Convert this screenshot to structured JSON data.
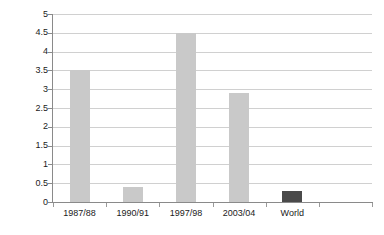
{
  "chart_data": {
    "type": "bar",
    "title": "",
    "subtitle": "",
    "xlabel": "",
    "ylabel": "",
    "categories": [
      "1987/88",
      "1990/91",
      "1997/98",
      "2003/04",
      "World",
      ""
    ],
    "values": [
      3.5,
      0.4,
      4.5,
      2.9,
      0.3,
      null
    ],
    "bar_colors": [
      "#c9c9c9",
      "#c9c9c9",
      "#c9c9c9",
      "#c9c9c9",
      "#4a4a4a",
      "#c9c9c9"
    ],
    "ylim": [
      0,
      5
    ],
    "ytick_step": 0.5,
    "ytick_labels": [
      "5",
      "4.5",
      "4",
      "3.5",
      "3",
      "2.5",
      "2",
      "1.5",
      "1",
      "0.5",
      "0"
    ],
    "ytick_values": [
      5,
      4.5,
      4,
      3.5,
      3,
      2.5,
      2,
      1.5,
      1,
      0.5,
      0
    ],
    "grid": true,
    "grid_axis": "y",
    "legend": null,
    "legend_position": "none",
    "annotations": [],
    "series": [
      {
        "name": "",
        "values": [
          3.5,
          0.4,
          4.5,
          2.9,
          0.3,
          null
        ]
      }
    ],
    "colors": {
      "background": "#ffffff",
      "gridline": "#d0d0d0",
      "axis": "#8a8a8a",
      "bar_light": "#c9c9c9",
      "bar_dark": "#4a4a4a",
      "text": "#1a1a1a"
    }
  }
}
